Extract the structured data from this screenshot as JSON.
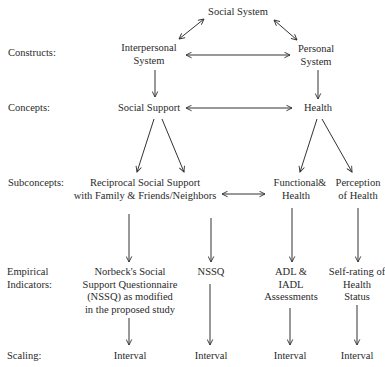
{
  "diagram": {
    "levels": [
      {
        "label": "Constructs:"
      },
      {
        "label": "Concepts:"
      },
      {
        "label": "Subconcepts:"
      },
      {
        "label": "Empirical\nIndicators:",
        "lines": [
          "Empirical",
          "Indicators:"
        ]
      },
      {
        "label": "Scaling:"
      }
    ],
    "nodes": {
      "social_system": "Social System",
      "interpersonal_system": [
        "Interpersonal",
        "System"
      ],
      "personal_system": [
        "Personal",
        "System"
      ],
      "social_support": "Social Support",
      "health": "Health",
      "reciprocal_support": [
        "Reciprocal Social Support",
        "with Family & Friends/Neighbors"
      ],
      "functional_health": [
        "Functional",
        "Health"
      ],
      "ampersand": "&",
      "perception_health": [
        "Perception",
        "of Health"
      ],
      "nssq_modified": [
        "Norbeck's Social",
        "Support Questionnaire",
        "(NSSQ) as modified",
        "in the proposed study"
      ],
      "nssq": "NSSQ",
      "adl": [
        "ADL &",
        "IADL",
        "Assessments"
      ],
      "self_rating": [
        "Self-rating of",
        "Health",
        "Status"
      ],
      "scaling": [
        "Interval",
        "Interval",
        "Interval",
        "Interval"
      ]
    },
    "edges": [
      {
        "from": "social_system",
        "to": "interpersonal_system",
        "type": "bidirectional"
      },
      {
        "from": "social_system",
        "to": "personal_system",
        "type": "bidirectional"
      },
      {
        "from": "interpersonal_system",
        "to": "personal_system",
        "type": "bidirectional"
      },
      {
        "from": "interpersonal_system",
        "to": "social_support",
        "type": "directed"
      },
      {
        "from": "personal_system",
        "to": "health",
        "type": "directed"
      },
      {
        "from": "social_support",
        "to": "health",
        "type": "bidirectional"
      },
      {
        "from": "social_support",
        "to": "reciprocal_support",
        "type": "directed",
        "count": 2
      },
      {
        "from": "health",
        "to": "functional_health",
        "type": "directed"
      },
      {
        "from": "health",
        "to": "perception_health",
        "type": "directed"
      },
      {
        "from": "reciprocal_support",
        "to": "functional_health",
        "type": "bidirectional"
      },
      {
        "from": "reciprocal_support",
        "to": "nssq_modified",
        "type": "directed"
      },
      {
        "from": "reciprocal_support",
        "to": "nssq",
        "type": "directed"
      },
      {
        "from": "functional_health",
        "to": "adl",
        "type": "directed"
      },
      {
        "from": "perception_health",
        "to": "self_rating",
        "type": "directed"
      },
      {
        "from": "nssq_modified",
        "to": "scaling.0",
        "type": "directed"
      },
      {
        "from": "nssq",
        "to": "scaling.1",
        "type": "directed"
      },
      {
        "from": "adl",
        "to": "scaling.2",
        "type": "directed"
      },
      {
        "from": "self_rating",
        "to": "scaling.3",
        "type": "directed"
      }
    ]
  }
}
